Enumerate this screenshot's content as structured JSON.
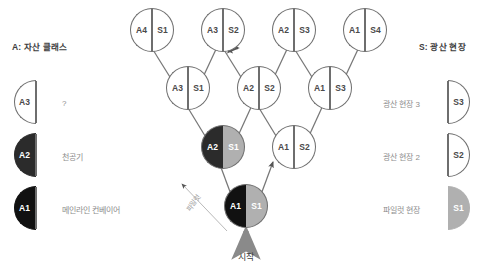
{
  "diagram": {
    "start_label": "시작",
    "pilot_label": "파일럿",
    "nodes": [
      {
        "id": "n-a4s1",
        "asset": "A4",
        "site": "S1",
        "asset_fill": "white",
        "site_fill": "white",
        "x": 130,
        "y": 8
      },
      {
        "id": "n-a3s2",
        "asset": "A3",
        "site": "S2",
        "asset_fill": "white",
        "site_fill": "white",
        "x": 201,
        "y": 8
      },
      {
        "id": "n-a2s3",
        "asset": "A2",
        "site": "S3",
        "asset_fill": "white",
        "site_fill": "white",
        "x": 272,
        "y": 8
      },
      {
        "id": "n-a1s4",
        "asset": "A1",
        "site": "S4",
        "asset_fill": "white",
        "site_fill": "white",
        "x": 343,
        "y": 8
      },
      {
        "id": "n-a3s1",
        "asset": "A3",
        "site": "S1",
        "asset_fill": "white",
        "site_fill": "white",
        "x": 166,
        "y": 66
      },
      {
        "id": "n-a2s2",
        "asset": "A2",
        "site": "S2",
        "asset_fill": "white",
        "site_fill": "white",
        "x": 237,
        "y": 66
      },
      {
        "id": "n-a1s3",
        "asset": "A1",
        "site": "S3",
        "asset_fill": "white",
        "site_fill": "white",
        "x": 308,
        "y": 66
      },
      {
        "id": "n-a2s1",
        "asset": "A2",
        "site": "S1",
        "asset_fill": "dark",
        "site_fill": "gray",
        "x": 201,
        "y": 125
      },
      {
        "id": "n-a1s2",
        "asset": "A1",
        "site": "S2",
        "asset_fill": "white",
        "site_fill": "white",
        "x": 272,
        "y": 125
      },
      {
        "id": "n-a1s1",
        "asset": "A1",
        "site": "S1",
        "asset_fill": "black",
        "site_fill": "gray",
        "x": 224,
        "y": 184
      }
    ]
  },
  "legend_left": {
    "title": "A: 자산 클래스",
    "items": [
      {
        "code": "A3",
        "label": "?",
        "fill": "white"
      },
      {
        "code": "A2",
        "label": "천공기",
        "fill": "dark"
      },
      {
        "code": "A1",
        "label": "메인라인 컨베이어",
        "fill": "black"
      }
    ]
  },
  "legend_right": {
    "title": "S: 광산 현장",
    "items": [
      {
        "code": "S3",
        "label": "광산 현장 3",
        "fill": "white"
      },
      {
        "code": "S2",
        "label": "광산 현장 2",
        "fill": "white"
      },
      {
        "code": "S1",
        "label": "파일럿 현장",
        "fill": "gray"
      }
    ]
  },
  "colors": {
    "stroke": "#6e6e6e",
    "arrow": "#555555",
    "black": "#111111",
    "dark": "#2b2b2b",
    "gray": "#b0b0b0",
    "text_muted": "#8d8d8d"
  }
}
